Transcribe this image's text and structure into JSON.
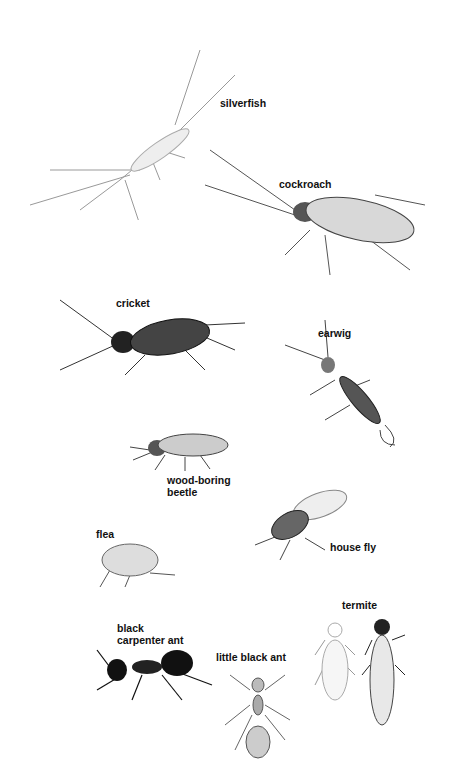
{
  "labels": [
    {
      "id": "silverfish",
      "text": "silverfish",
      "x": 220,
      "y": 97
    },
    {
      "id": "cockroach",
      "text": "cockroach",
      "x": 279,
      "y": 178
    },
    {
      "id": "cricket",
      "text": "cricket",
      "x": 116,
      "y": 297
    },
    {
      "id": "earwig",
      "text": "earwig",
      "x": 318,
      "y": 327
    },
    {
      "id": "wood-boring-beetle",
      "text": "wood-boring\nbeetle",
      "x": 167,
      "y": 474
    },
    {
      "id": "flea",
      "text": "flea",
      "x": 96,
      "y": 528
    },
    {
      "id": "house-fly",
      "text": "house fly",
      "x": 330,
      "y": 541
    },
    {
      "id": "termite",
      "text": "termite",
      "x": 342,
      "y": 599
    },
    {
      "id": "black-carpenter-ant",
      "text": "black\ncarpenter ant",
      "x": 117,
      "y": 622
    },
    {
      "id": "little-black-ant",
      "text": "little black ant",
      "x": 216,
      "y": 651
    }
  ]
}
